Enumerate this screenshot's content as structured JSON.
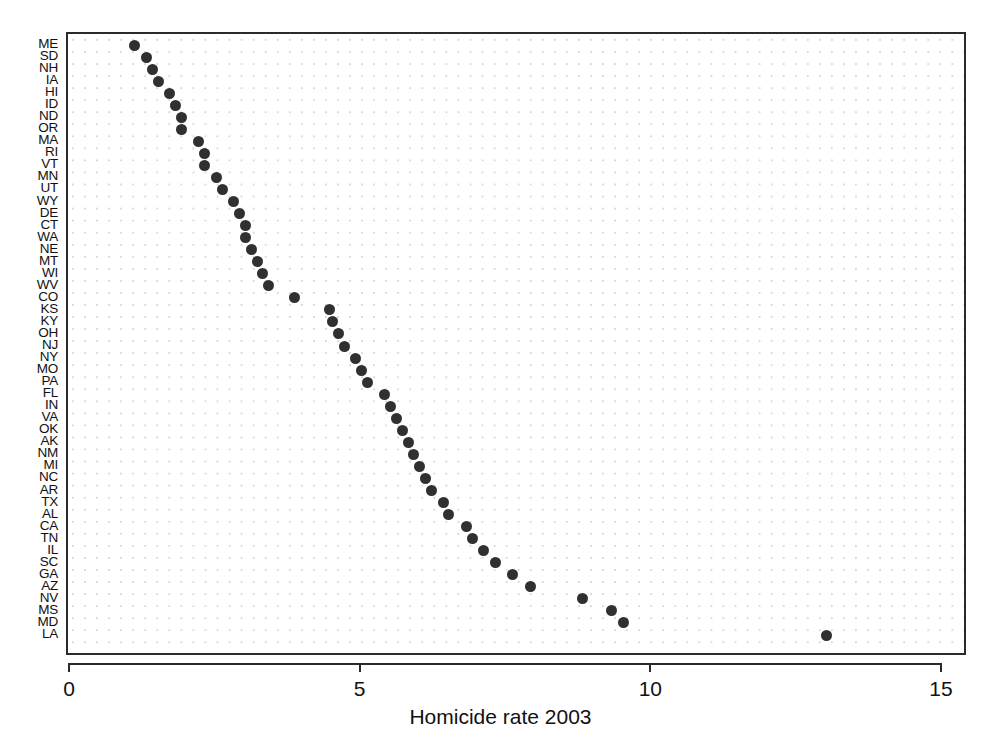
{
  "chart_data": {
    "type": "scatter",
    "title": "",
    "subtitle": "",
    "xlabel": "Homicide rate 2003",
    "ylabel": "",
    "xlim": [
      0,
      15
    ],
    "xticks": [
      0,
      5,
      10,
      15
    ],
    "xticklabels": [
      "0",
      "5",
      "10",
      "15"
    ],
    "grid": "dotted",
    "legend": "none",
    "orientation": "horizontal-dotplot",
    "marker": {
      "shape": "circle",
      "color": "#303030",
      "size": 11
    },
    "categories": [
      "ME",
      "SD",
      "NH",
      "IA",
      "HI",
      "ID",
      "ND",
      "OR",
      "MA",
      "RI",
      "VT",
      "MN",
      "UT",
      "WY",
      "DE",
      "CT",
      "WA",
      "NE",
      "MT",
      "WI",
      "WV",
      "CO",
      "KS",
      "KY",
      "OH",
      "NJ",
      "NY",
      "MO",
      "PA",
      "FL",
      "IN",
      "VA",
      "OK",
      "AK",
      "NM",
      "MI",
      "NC",
      "AR",
      "TX",
      "AL",
      "CA",
      "TN",
      "IL",
      "SC",
      "GA",
      "AZ",
      "NV",
      "MS",
      "MD",
      "LA"
    ],
    "values": [
      1.1,
      1.3,
      1.4,
      1.5,
      1.7,
      1.8,
      1.9,
      1.9,
      2.2,
      2.3,
      2.3,
      2.5,
      2.6,
      2.8,
      2.9,
      3.0,
      3.0,
      3.1,
      3.2,
      3.3,
      3.4,
      3.85,
      4.45,
      4.5,
      4.6,
      4.7,
      4.9,
      5.0,
      5.1,
      5.4,
      5.5,
      5.6,
      5.7,
      5.8,
      5.9,
      6.0,
      6.1,
      6.2,
      6.4,
      6.5,
      6.8,
      6.9,
      7.1,
      7.3,
      7.6,
      7.9,
      8.8,
      9.3,
      9.5,
      13.0
    ],
    "points": [
      {
        "state": "ME",
        "rate": 1.1
      },
      {
        "state": "SD",
        "rate": 1.3
      },
      {
        "state": "NH",
        "rate": 1.4
      },
      {
        "state": "IA",
        "rate": 1.5
      },
      {
        "state": "HI",
        "rate": 1.7
      },
      {
        "state": "ID",
        "rate": 1.8
      },
      {
        "state": "ND",
        "rate": 1.9
      },
      {
        "state": "OR",
        "rate": 1.9
      },
      {
        "state": "MA",
        "rate": 2.2
      },
      {
        "state": "RI",
        "rate": 2.3
      },
      {
        "state": "VT",
        "rate": 2.3
      },
      {
        "state": "MN",
        "rate": 2.5
      },
      {
        "state": "UT",
        "rate": 2.6
      },
      {
        "state": "WY",
        "rate": 2.8
      },
      {
        "state": "DE",
        "rate": 2.9
      },
      {
        "state": "CT",
        "rate": 3.0
      },
      {
        "state": "WA",
        "rate": 3.0
      },
      {
        "state": "NE",
        "rate": 3.1
      },
      {
        "state": "MT",
        "rate": 3.2
      },
      {
        "state": "WI",
        "rate": 3.3
      },
      {
        "state": "WV",
        "rate": 3.4
      },
      {
        "state": "CO",
        "rate": 3.85
      },
      {
        "state": "KS",
        "rate": 4.45
      },
      {
        "state": "KY",
        "rate": 4.5
      },
      {
        "state": "OH",
        "rate": 4.6
      },
      {
        "state": "NJ",
        "rate": 4.7
      },
      {
        "state": "NY",
        "rate": 4.9
      },
      {
        "state": "MO",
        "rate": 5.0
      },
      {
        "state": "PA",
        "rate": 5.1
      },
      {
        "state": "FL",
        "rate": 5.4
      },
      {
        "state": "IN",
        "rate": 5.5
      },
      {
        "state": "VA",
        "rate": 5.6
      },
      {
        "state": "OK",
        "rate": 5.7
      },
      {
        "state": "AK",
        "rate": 5.8
      },
      {
        "state": "NM",
        "rate": 5.9
      },
      {
        "state": "MI",
        "rate": 6.0
      },
      {
        "state": "NC",
        "rate": 6.1
      },
      {
        "state": "AR",
        "rate": 6.2
      },
      {
        "state": "TX",
        "rate": 6.4
      },
      {
        "state": "AL",
        "rate": 6.5
      },
      {
        "state": "CA",
        "rate": 6.8
      },
      {
        "state": "TN",
        "rate": 6.9
      },
      {
        "state": "IL",
        "rate": 7.1
      },
      {
        "state": "SC",
        "rate": 7.3
      },
      {
        "state": "GA",
        "rate": 7.6
      },
      {
        "state": "AZ",
        "rate": 7.9
      },
      {
        "state": "NV",
        "rate": 8.8
      },
      {
        "state": "MS",
        "rate": 9.3
      },
      {
        "state": "MD",
        "rate": 9.5
      },
      {
        "state": "LA",
        "rate": 13.0
      }
    ]
  }
}
